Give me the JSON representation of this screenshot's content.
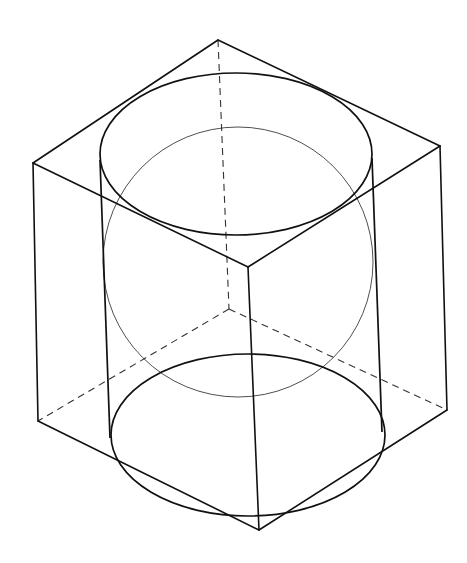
{
  "diagram": {
    "title": "",
    "colors": {
      "line": "#111111",
      "background": "#ffffff"
    },
    "cube": {
      "visible_edges": [
        [
          218,
          40,
          33,
          163
        ],
        [
          218,
          40,
          440,
          146
        ],
        [
          33,
          163,
          248,
          267
        ],
        [
          440,
          146,
          248,
          267
        ],
        [
          33,
          163,
          38,
          421
        ],
        [
          440,
          146,
          447,
          410
        ],
        [
          248,
          267,
          259,
          530
        ],
        [
          38,
          421,
          259,
          530
        ],
        [
          447,
          410,
          259,
          530
        ]
      ],
      "hidden_edges": [
        [
          218,
          40,
          229,
          309
        ],
        [
          229,
          309,
          38,
          421
        ],
        [
          229,
          309,
          447,
          410
        ]
      ]
    },
    "cylinder": {
      "top_ellipse": {
        "cx": 236,
        "cy": 154,
        "rx": 136,
        "ry": 81
      },
      "bottom_ellipse": {
        "cx": 248,
        "cy": 435,
        "rx": 137,
        "ry": 81
      },
      "sides": [
        [
          100,
          160,
          110,
          438
        ],
        [
          372,
          158,
          382,
          432
        ]
      ]
    },
    "sphere": {
      "cx": 238,
      "cy": 262,
      "r": 135
    }
  }
}
